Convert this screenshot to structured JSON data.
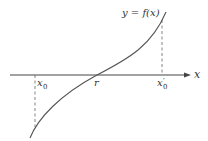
{
  "diagram": {
    "curve_label": "y = f(x)",
    "axis_label": "x",
    "points": {
      "x0": {
        "base": "x",
        "sub": "0"
      },
      "root": "r",
      "x0_prime": {
        "base": "x",
        "prime": "′",
        "sub": "0"
      }
    },
    "colors": {
      "axis": "#444444",
      "curve": "#555555",
      "dashed": "#666666",
      "text": "#333333"
    }
  }
}
